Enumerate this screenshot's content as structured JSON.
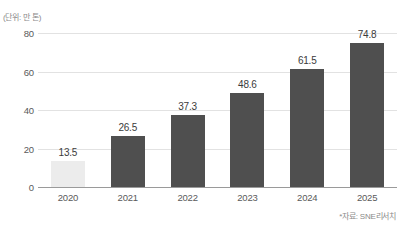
{
  "caption": {
    "unit_label": "(단위: 만 톤)",
    "source_label": "*자료: SNE리서치"
  },
  "chart_data": {
    "type": "bar",
    "title": "",
    "subtitle": "",
    "xlabel": "",
    "ylabel": "(단위: 만 톤)",
    "categories": [
      "2020",
      "2021",
      "2022",
      "2023",
      "2024",
      "2025"
    ],
    "values": [
      13.5,
      26.5,
      37.3,
      48.6,
      61.5,
      74.8
    ],
    "value_labels": [
      "13.5",
      "26.5",
      "37.3",
      "48.6",
      "61.5",
      "74.8"
    ],
    "series": [
      {
        "name": "",
        "values": [
          13.5,
          26.5,
          37.3,
          48.6,
          61.5,
          74.8
        ]
      }
    ],
    "ylim": [
      0,
      80
    ],
    "yticks": [
      0,
      20,
      40,
      60,
      80
    ],
    "ytick_labels": [
      "0",
      "20",
      "40",
      "60",
      "80"
    ],
    "grid": true,
    "legend": "none",
    "bar_colors": [
      "#ececec",
      "#4f4f4f",
      "#4f4f4f",
      "#4f4f4f",
      "#4f4f4f",
      "#4f4f4f"
    ],
    "highlight_color": "#ececec",
    "primary_color": "#4f4f4f",
    "gridline_color": "#e2e2e2",
    "axis_color": "#9a9a9a",
    "annotations": [
      "*자료: SNE리서치"
    ]
  }
}
